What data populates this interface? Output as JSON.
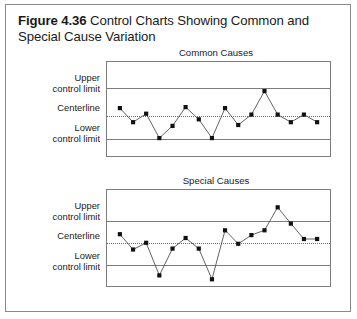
{
  "figure": {
    "label": "Figure 4.36",
    "title": "Control Charts Showing Common and Special Cause Variation"
  },
  "axis_labels": {
    "upper": "Upper\ncontrol limit",
    "upper_line1": "Upper",
    "upper_line2": "control limit",
    "center": "Centerline",
    "lower_line1": "Lower",
    "lower_line2": "control limit"
  },
  "colors": {
    "frame": "#8a8a8a",
    "plot_border": "#7d7d7d",
    "limit_line": "#7d7d7d",
    "center_line": "#6f6f6f",
    "series_line": "#3a3a3a",
    "marker": "#111111",
    "text": "#1a1a1a",
    "background": "#ffffff"
  },
  "chart_data": [
    {
      "type": "line",
      "id": "common-causes",
      "title": "Common Causes",
      "xlabel": "",
      "ylabel": "",
      "grid": false,
      "legend": "none",
      "ylim": [
        0,
        100
      ],
      "reference_lines": [
        {
          "name": "Upper control limit",
          "value": 72,
          "style": "solid"
        },
        {
          "name": "Centerline",
          "value": 43,
          "style": "dotted"
        },
        {
          "name": "Lower control limit",
          "value": 18,
          "style": "solid"
        }
      ],
      "x": [
        1,
        2,
        3,
        4,
        5,
        6,
        7,
        8,
        9,
        10,
        11,
        12,
        13,
        14,
        15,
        16
      ],
      "values": [
        51,
        36,
        45,
        19,
        32,
        52,
        39,
        19,
        51,
        33,
        44,
        69,
        44,
        36,
        44,
        36
      ],
      "annotation": "All points fall within the control limits"
    },
    {
      "type": "line",
      "id": "special-causes",
      "title": "Special Causes",
      "xlabel": "",
      "ylabel": "",
      "grid": false,
      "legend": "none",
      "ylim": [
        0,
        100
      ],
      "reference_lines": [
        {
          "name": "Upper control limit",
          "value": 68,
          "style": "solid"
        },
        {
          "name": "Centerline",
          "value": 45,
          "style": "dotted"
        },
        {
          "name": "Lower control limit",
          "value": 22,
          "style": "solid"
        }
      ],
      "x": [
        1,
        2,
        3,
        4,
        5,
        6,
        7,
        8,
        9,
        10,
        11,
        12,
        13,
        14,
        15,
        16
      ],
      "values": [
        54,
        38,
        45,
        11,
        39,
        50,
        39,
        7,
        58,
        44,
        53,
        58,
        82,
        65,
        49,
        49
      ],
      "annotation": "Points fall outside the upper and lower control limits"
    }
  ]
}
